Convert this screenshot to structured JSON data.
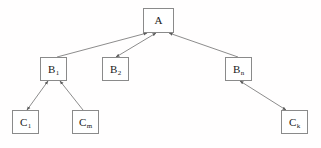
{
  "diagram": {
    "background_color": "#fffefe",
    "box_border_color": "#8a8a8a",
    "box_fill_color": "#ffffff",
    "edge_color": "#6e6e6e",
    "text_color": "#1a1a1a",
    "nodes": [
      {
        "id": "A",
        "base": "A",
        "sub": "",
        "label": "A",
        "x": 143,
        "y": 8,
        "w": 31,
        "h": 25
      },
      {
        "id": "B1",
        "base": "B",
        "sub": "1",
        "label": "B1",
        "x": 40,
        "y": 57,
        "w": 27,
        "h": 24
      },
      {
        "id": "B2",
        "base": "B",
        "sub": "2",
        "label": "B2",
        "x": 102,
        "y": 57,
        "w": 27,
        "h": 24
      },
      {
        "id": "Bn",
        "base": "B",
        "sub": "n",
        "label": "Bn",
        "x": 225,
        "y": 57,
        "w": 27,
        "h": 24
      },
      {
        "id": "C1",
        "base": "C",
        "sub": "1",
        "label": "C1",
        "x": 12,
        "y": 110,
        "w": 27,
        "h": 24
      },
      {
        "id": "Cm",
        "base": "C",
        "sub": "m",
        "label": "Cm",
        "x": 72,
        "y": 110,
        "w": 27,
        "h": 24
      },
      {
        "id": "Ck",
        "base": "C",
        "sub": "k",
        "label": "Ck",
        "x": 281,
        "y": 110,
        "w": 27,
        "h": 24
      }
    ],
    "edges": [
      {
        "from": "B1",
        "to": "A",
        "arrow_at_from": false,
        "arrow_at_to": true
      },
      {
        "from": "A",
        "to": "B2",
        "arrow_at_from": true,
        "arrow_at_to": true
      },
      {
        "from": "Bn",
        "to": "A",
        "arrow_at_from": false,
        "arrow_at_to": true
      },
      {
        "from": "C1",
        "to": "B1",
        "arrow_at_from": true,
        "arrow_at_to": true
      },
      {
        "from": "Cm",
        "to": "B1",
        "arrow_at_from": false,
        "arrow_at_to": true
      },
      {
        "from": "Ck",
        "to": "Bn",
        "arrow_at_from": true,
        "arrow_at_to": true
      }
    ]
  }
}
